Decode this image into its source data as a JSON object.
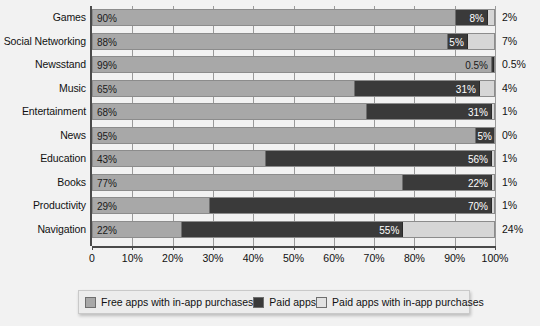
{
  "chart_data": {
    "type": "bar",
    "subtype": "stacked-horizontal-100",
    "title": "",
    "xlabel": "",
    "ylabel": "",
    "xlim": [
      0,
      100
    ],
    "grid": true,
    "legend_position": "bottom",
    "categories": [
      "Games",
      "Social Networking",
      "Newsstand",
      "Music",
      "Entertainment",
      "News",
      "Education",
      "Books",
      "Productivity",
      "Navigation"
    ],
    "series": [
      {
        "name": "Free apps with in-app purchases",
        "color": "#a8a8a8",
        "values": [
          90,
          88,
          99,
          65,
          68,
          95,
          43,
          77,
          29,
          22
        ],
        "labels": [
          "90%",
          "88%",
          "99%",
          "65%",
          "68%",
          "95%",
          "43%",
          "77%",
          "29%",
          "22%"
        ]
      },
      {
        "name": "Paid apps",
        "color": "#3a3a3a",
        "values": [
          8,
          5,
          0.5,
          31,
          31,
          5,
          56,
          22,
          70,
          55
        ],
        "labels": [
          "8%",
          "5%",
          "0.5%",
          "31%",
          "31%",
          "5%",
          "56%",
          "22%",
          "70%",
          "55%"
        ]
      },
      {
        "name": "Paid apps with in-app purchases",
        "color": "#d6d6d6",
        "values": [
          2,
          7,
          0.5,
          4,
          1,
          0,
          1,
          1,
          1,
          24
        ],
        "labels": [
          "2%",
          "7%",
          "0.5%",
          "4%",
          "1%",
          "0%",
          "1%",
          "1%",
          "1%",
          "24%"
        ]
      }
    ],
    "xticks": [
      0,
      10,
      20,
      30,
      40,
      50,
      60,
      70,
      80,
      90,
      100
    ],
    "xtick_labels": [
      "0",
      "10%",
      "20%",
      "30%",
      "40%",
      "50%",
      "60%",
      "70%",
      "80%",
      "90%",
      "100%"
    ]
  },
  "legend": {
    "items": [
      {
        "label": "Free apps with in-app purchases",
        "swatch": "free-swatch"
      },
      {
        "label": "Paid apps",
        "swatch": "paid-swatch"
      },
      {
        "label": "Paid apps with in-app purchases",
        "swatch": "paid-iap-swatch"
      }
    ]
  }
}
